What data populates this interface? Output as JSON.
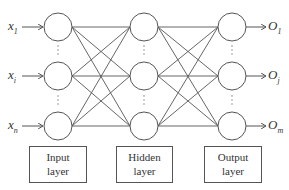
{
  "diagram": {
    "type": "neural-network",
    "layers": [
      {
        "name": "Input layer",
        "label_line1": "Input",
        "label_line2": "layer",
        "nodes": [
          "x1",
          "xi",
          "xn"
        ]
      },
      {
        "name": "Hidden layer",
        "label_line1": "Hidden",
        "label_line2": "layer",
        "nodes": [
          "h1",
          "hj",
          "hk"
        ]
      },
      {
        "name": "Output layer",
        "label_line1": "Output",
        "label_line2": "layer",
        "nodes": [
          "O1",
          "Oj",
          "Om"
        ]
      }
    ],
    "inputs": [
      {
        "base": "x",
        "sub": "1"
      },
      {
        "base": "x",
        "sub": "i"
      },
      {
        "base": "x",
        "sub": "n"
      }
    ],
    "outputs": [
      {
        "base": "O",
        "sub": "1"
      },
      {
        "base": "O",
        "sub": "j"
      },
      {
        "base": "O",
        "sub": "m"
      }
    ],
    "colors": {
      "stroke": "#555555",
      "text": "#333333",
      "background": "#ffffff"
    }
  }
}
